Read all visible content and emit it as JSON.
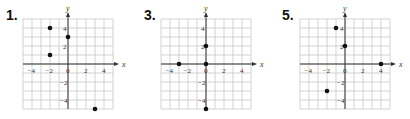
{
  "chart_data": [
    {
      "type": "scatter",
      "title": "1.",
      "xlabel": "x",
      "ylabel": "y",
      "xlim": [
        -5,
        5
      ],
      "ylim": [
        -5,
        5
      ],
      "grid": true,
      "x_ticks": [
        -4,
        -2,
        0,
        2,
        4
      ],
      "y_ticks": [
        4,
        2,
        -2,
        -4
      ],
      "points": [
        [
          -2,
          4
        ],
        [
          0,
          3
        ],
        [
          -2,
          1
        ],
        [
          3,
          -5
        ]
      ]
    },
    {
      "type": "scatter",
      "title": "3.",
      "xlabel": "x",
      "ylabel": "y",
      "xlim": [
        -5,
        5
      ],
      "ylim": [
        -5,
        5
      ],
      "grid": true,
      "x_ticks": [
        -4,
        -2,
        0,
        2,
        4
      ],
      "y_ticks": [
        4,
        2,
        -2,
        -4
      ],
      "points": [
        [
          0,
          2
        ],
        [
          -3,
          0
        ],
        [
          0,
          0
        ],
        [
          0,
          -5
        ]
      ]
    },
    {
      "type": "scatter",
      "title": "5.",
      "xlabel": "x",
      "ylabel": "y",
      "xlim": [
        -5,
        5
      ],
      "ylim": [
        -5,
        5
      ],
      "grid": true,
      "x_ticks": [
        -4,
        -2,
        0,
        2,
        4
      ],
      "y_ticks": [
        4,
        2,
        -2,
        -4
      ],
      "points": [
        [
          -1,
          4
        ],
        [
          0,
          2
        ],
        [
          4,
          0
        ],
        [
          -2,
          -3
        ]
      ]
    }
  ],
  "panels": [
    {
      "label": "1."
    },
    {
      "label": "3."
    },
    {
      "label": "5."
    }
  ],
  "colors": {
    "grid": "#c8c8c8",
    "axis": "#333333",
    "point": "#111111"
  }
}
